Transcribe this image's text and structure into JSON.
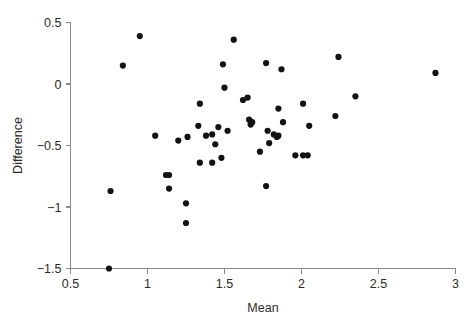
{
  "chart_data": {
    "type": "scatter",
    "title": "",
    "xlabel": "Mean",
    "ylabel": "Difference",
    "xlim": [
      0.5,
      3.0
    ],
    "ylim": [
      -1.5,
      0.5
    ],
    "xticks": [
      "0.5",
      "1",
      "1.5",
      "2",
      "2.5",
      "3"
    ],
    "xtick_values": [
      0.5,
      1,
      1.5,
      2,
      2.5,
      3
    ],
    "yticks": [
      "0.5",
      "0",
      "−0.5",
      "−1",
      "−1.5"
    ],
    "ytick_values": [
      0.5,
      0,
      -0.5,
      -1,
      -1.5
    ],
    "grid": false,
    "legend": null,
    "marker": "filled-circle",
    "marker_color": "#131313",
    "axis_color": "#8a8a8a",
    "background": "#ffffff",
    "n_points": 60,
    "points": [
      {
        "x": 0.75,
        "y": -1.5
      },
      {
        "x": 0.76,
        "y": -0.87
      },
      {
        "x": 0.84,
        "y": 0.15
      },
      {
        "x": 0.95,
        "y": 0.39
      },
      {
        "x": 1.05,
        "y": -0.42
      },
      {
        "x": 1.12,
        "y": -0.74
      },
      {
        "x": 1.14,
        "y": -0.74
      },
      {
        "x": 1.14,
        "y": -0.85
      },
      {
        "x": 1.2,
        "y": -0.46
      },
      {
        "x": 1.25,
        "y": -0.97
      },
      {
        "x": 1.25,
        "y": -1.13
      },
      {
        "x": 1.26,
        "y": -0.43
      },
      {
        "x": 1.33,
        "y": -0.34
      },
      {
        "x": 1.34,
        "y": -0.16
      },
      {
        "x": 1.34,
        "y": -0.64
      },
      {
        "x": 1.38,
        "y": -0.42
      },
      {
        "x": 1.42,
        "y": -0.41
      },
      {
        "x": 1.42,
        "y": -0.64
      },
      {
        "x": 1.44,
        "y": -0.49
      },
      {
        "x": 1.46,
        "y": -0.35
      },
      {
        "x": 1.48,
        "y": -0.6
      },
      {
        "x": 1.49,
        "y": 0.16
      },
      {
        "x": 1.5,
        "y": -0.03
      },
      {
        "x": 1.52,
        "y": -0.38
      },
      {
        "x": 1.56,
        "y": 0.36
      },
      {
        "x": 1.62,
        "y": -0.13
      },
      {
        "x": 1.65,
        "y": -0.11
      },
      {
        "x": 1.66,
        "y": -0.29
      },
      {
        "x": 1.67,
        "y": -0.33
      },
      {
        "x": 1.68,
        "y": -0.31
      },
      {
        "x": 1.73,
        "y": -0.55
      },
      {
        "x": 1.77,
        "y": 0.17
      },
      {
        "x": 1.77,
        "y": -0.83
      },
      {
        "x": 1.78,
        "y": -0.38
      },
      {
        "x": 1.79,
        "y": -0.48
      },
      {
        "x": 1.82,
        "y": -0.41
      },
      {
        "x": 1.84,
        "y": -0.43
      },
      {
        "x": 1.85,
        "y": -0.2
      },
      {
        "x": 1.85,
        "y": -0.42
      },
      {
        "x": 1.87,
        "y": 0.12
      },
      {
        "x": 1.88,
        "y": -0.31
      },
      {
        "x": 1.96,
        "y": -0.58
      },
      {
        "x": 2.01,
        "y": -0.16
      },
      {
        "x": 2.01,
        "y": -0.58
      },
      {
        "x": 2.04,
        "y": -0.58
      },
      {
        "x": 2.05,
        "y": -0.34
      },
      {
        "x": 2.22,
        "y": -0.26
      },
      {
        "x": 2.24,
        "y": 0.22
      },
      {
        "x": 2.35,
        "y": -0.1
      },
      {
        "x": 2.87,
        "y": 0.09
      }
    ]
  },
  "figure": {
    "xlabel": "Mean",
    "ylabel": "Difference"
  }
}
